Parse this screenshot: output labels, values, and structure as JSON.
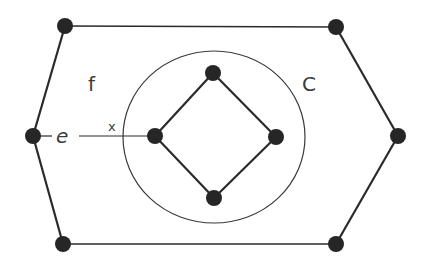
{
  "diagram": {
    "type": "planar-graph",
    "labels": {
      "face": "f",
      "curve": "C",
      "edge": "e",
      "crossing": "x"
    },
    "outer_vertices": [
      {
        "id": "h1",
        "x": 65,
        "y": 26
      },
      {
        "id": "h2",
        "x": 336,
        "y": 27
      },
      {
        "id": "h3",
        "x": 398,
        "y": 136
      },
      {
        "id": "h4",
        "x": 336,
        "y": 244
      },
      {
        "id": "h5",
        "x": 63,
        "y": 244
      },
      {
        "id": "h6",
        "x": 33,
        "y": 136
      }
    ],
    "inner_vertices": [
      {
        "id": "d1",
        "x": 213,
        "y": 73
      },
      {
        "id": "d2",
        "x": 276,
        "y": 137
      },
      {
        "id": "d3",
        "x": 214,
        "y": 198
      },
      {
        "id": "d4",
        "x": 155,
        "y": 136
      }
    ],
    "curve_c": {
      "cx": 214,
      "cy": 137,
      "rx": 91,
      "ry": 86
    },
    "colors": {
      "ink": "#2a2a2a",
      "node": "#262626",
      "text": "#3a3a3a",
      "background": "#ffffff"
    }
  }
}
